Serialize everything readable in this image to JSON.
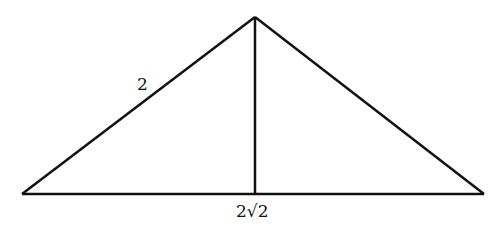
{
  "diagram": {
    "type": "triangle-with-altitude",
    "stroke_color": "#111111",
    "vertices": {
      "left": [
        22,
        194
      ],
      "apex": [
        255,
        17
      ],
      "right": [
        484,
        194
      ],
      "foot": [
        255,
        194
      ]
    },
    "labels": {
      "left_side": "2",
      "base": "2√2"
    }
  }
}
